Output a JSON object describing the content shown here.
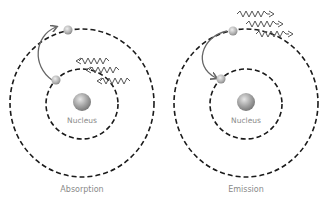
{
  "diagrams": [
    {
      "id": "absorption",
      "caption": "Absorption",
      "nucleus_label": "Nucleus",
      "center": [
        82,
        104
      ],
      "photon_direction": "incoming"
    },
    {
      "id": "emission",
      "caption": "Emission",
      "nucleus_label": "Nucleus",
      "center": [
        246,
        104
      ],
      "photon_direction": "outgoing"
    }
  ],
  "colors": {
    "orbit": "#1a1a1a",
    "arrow": "#666666",
    "nucleus": "#9a9a9a",
    "electron": "#a8a8a8",
    "label": "#8a8a8a"
  }
}
